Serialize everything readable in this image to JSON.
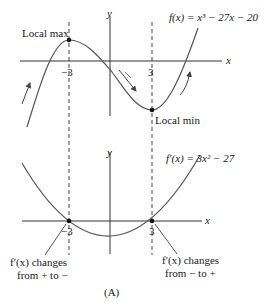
{
  "figure": {
    "caption": "(A)",
    "top_graph": {
      "function_label": "f(x) = x³ − 27x − 20",
      "axis_x": "x",
      "axis_y": "y",
      "tick_neg": "−3",
      "tick_pos": "3",
      "local_max_label": "Local max",
      "local_min_label": "Local min"
    },
    "bottom_graph": {
      "function_label": "f′(x) = 3x² − 27",
      "axis_x": "x",
      "axis_y": "y",
      "tick_neg": "−3",
      "tick_pos": "3",
      "left_note_line1": "f′(x) changes",
      "left_note_line2": "from + to −",
      "right_note_line1": "f′(x) changes",
      "right_note_line2": "from − to +"
    },
    "colors": {
      "stroke": "#333333",
      "curve": "#555555",
      "text": "#1a1a1a"
    }
  }
}
